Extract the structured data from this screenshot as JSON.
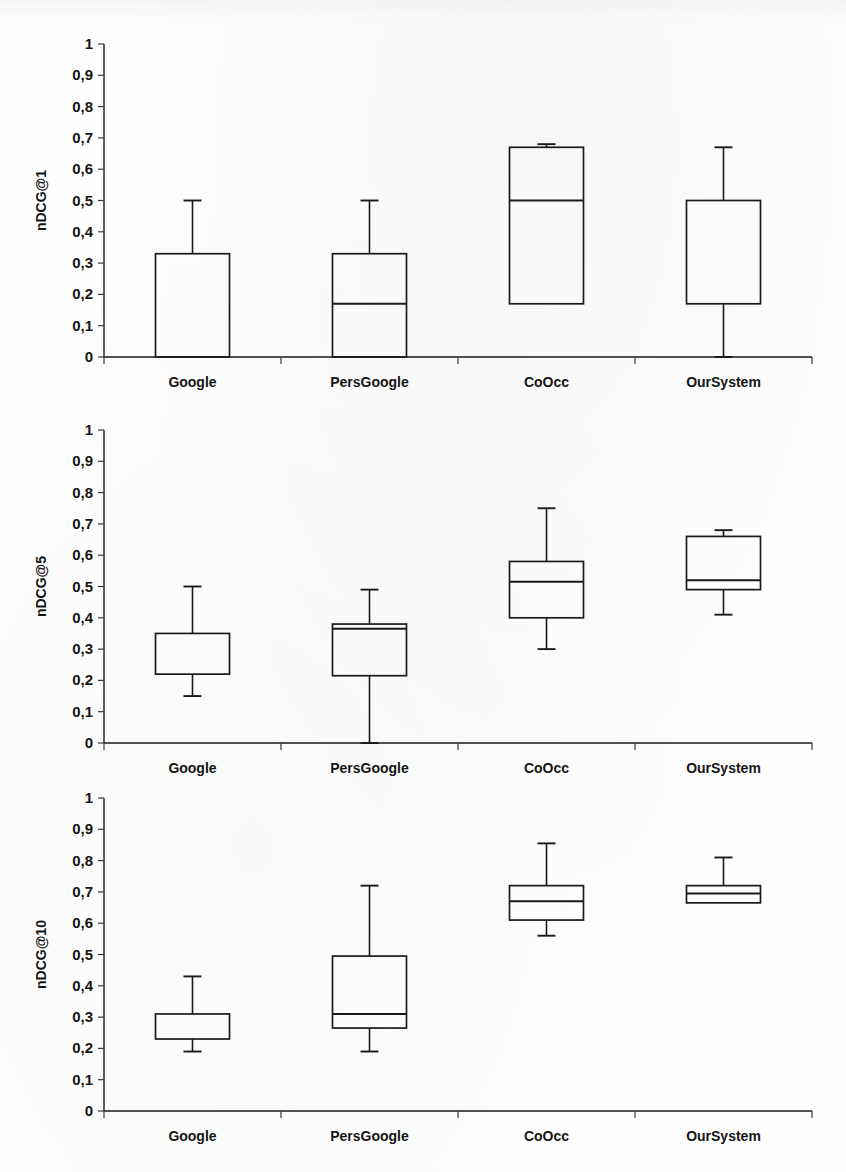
{
  "figure": {
    "background_color": "#fefefe",
    "ink_color": "#1a1a1a",
    "panel_count": 3
  },
  "chart_data": [
    {
      "type": "box",
      "title": "",
      "xlabel": "",
      "ylabel": "nDCG@1",
      "ylim": [
        0,
        1
      ],
      "ytick_labels": [
        "1",
        "0,9",
        "0,8",
        "0,7",
        "0,6",
        "0,5",
        "0,4",
        "0,3",
        "0,2",
        "0,1",
        "0"
      ],
      "ytick_values": [
        1,
        0.9,
        0.8,
        0.7,
        0.6,
        0.5,
        0.4,
        0.3,
        0.2,
        0.1,
        0
      ],
      "grid": false,
      "legend": "none",
      "categories": [
        "Google",
        "PersGoogle",
        "CoOcc",
        "OurSystem"
      ],
      "boxes": [
        {
          "category": "Google",
          "whisker_low": 0.0,
          "q1": 0.0,
          "median": 0.0,
          "q3": 0.33,
          "whisker_high": 0.5,
          "median_visible": false,
          "lower_whisker_visible": false
        },
        {
          "category": "PersGoogle",
          "whisker_low": 0.0,
          "q1": 0.0,
          "median": 0.17,
          "q3": 0.33,
          "whisker_high": 0.5,
          "median_visible": true,
          "lower_whisker_visible": false
        },
        {
          "category": "CoOcc",
          "whisker_low": 0.17,
          "q1": 0.17,
          "median": 0.5,
          "q3": 0.67,
          "whisker_high": 0.68,
          "median_visible": true,
          "lower_whisker_visible": false
        },
        {
          "category": "OurSystem",
          "whisker_low": 0.0,
          "q1": 0.17,
          "median": 0.17,
          "q3": 0.5,
          "whisker_high": 0.67,
          "median_visible": false,
          "lower_whisker_visible": true
        }
      ]
    },
    {
      "type": "box",
      "title": "",
      "xlabel": "",
      "ylabel": "nDCG@5",
      "ylim": [
        0,
        1
      ],
      "ytick_labels": [
        "1",
        "0,9",
        "0,8",
        "0,7",
        "0,6",
        "0,5",
        "0,4",
        "0,3",
        "0,2",
        "0,1",
        "0"
      ],
      "ytick_values": [
        1,
        0.9,
        0.8,
        0.7,
        0.6,
        0.5,
        0.4,
        0.3,
        0.2,
        0.1,
        0
      ],
      "grid": false,
      "legend": "none",
      "categories": [
        "Google",
        "PersGoogle",
        "CoOcc",
        "OurSystem"
      ],
      "boxes": [
        {
          "category": "Google",
          "whisker_low": 0.15,
          "q1": 0.22,
          "median": 0.22,
          "q3": 0.35,
          "whisker_high": 0.5,
          "median_visible": false,
          "lower_whisker_visible": true
        },
        {
          "category": "PersGoogle",
          "whisker_low": 0.0,
          "q1": 0.215,
          "median": 0.365,
          "q3": 0.38,
          "whisker_high": 0.49,
          "median_visible": true,
          "lower_whisker_visible": true
        },
        {
          "category": "CoOcc",
          "whisker_low": 0.3,
          "q1": 0.4,
          "median": 0.515,
          "q3": 0.58,
          "whisker_high": 0.75,
          "median_visible": true,
          "lower_whisker_visible": true
        },
        {
          "category": "OurSystem",
          "whisker_low": 0.41,
          "q1": 0.49,
          "median": 0.52,
          "q3": 0.66,
          "whisker_high": 0.68,
          "median_visible": true,
          "lower_whisker_visible": true
        }
      ]
    },
    {
      "type": "box",
      "title": "",
      "xlabel": "",
      "ylabel": "nDCG@10",
      "ylim": [
        0,
        1
      ],
      "ytick_labels": [
        "1",
        "0,9",
        "0,8",
        "0,7",
        "0,6",
        "0,5",
        "0,4",
        "0,3",
        "0,2",
        "0,1",
        "0"
      ],
      "ytick_values": [
        1,
        0.9,
        0.8,
        0.7,
        0.6,
        0.5,
        0.4,
        0.3,
        0.2,
        0.1,
        0
      ],
      "grid": false,
      "legend": "none",
      "categories": [
        "Google",
        "PersGoogle",
        "CoOcc",
        "OurSystem"
      ],
      "boxes": [
        {
          "category": "Google",
          "whisker_low": 0.19,
          "q1": 0.23,
          "median": 0.23,
          "q3": 0.31,
          "whisker_high": 0.43,
          "median_visible": false,
          "lower_whisker_visible": true
        },
        {
          "category": "PersGoogle",
          "whisker_low": 0.19,
          "q1": 0.265,
          "median": 0.31,
          "q3": 0.495,
          "whisker_high": 0.72,
          "median_visible": true,
          "lower_whisker_visible": true
        },
        {
          "category": "CoOcc",
          "whisker_low": 0.56,
          "q1": 0.61,
          "median": 0.67,
          "q3": 0.72,
          "whisker_high": 0.855,
          "median_visible": true,
          "lower_whisker_visible": true
        },
        {
          "category": "OurSystem",
          "whisker_low": 0.665,
          "q1": 0.665,
          "median": 0.695,
          "q3": 0.72,
          "whisker_high": 0.81,
          "median_visible": true,
          "lower_whisker_visible": false
        }
      ]
    }
  ]
}
